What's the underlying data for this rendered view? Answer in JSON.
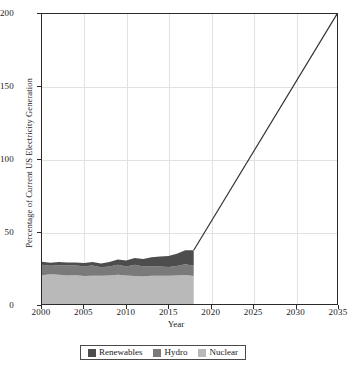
{
  "chart_data": {
    "type": "area",
    "title": "",
    "xlabel": "Year",
    "ylabel": "Percentage of Current US Electricity Generation",
    "xlim": [
      2000,
      2035
    ],
    "ylim": [
      0,
      200
    ],
    "xticks": [
      2000,
      2005,
      2010,
      2015,
      2020,
      2025,
      2030,
      2035
    ],
    "yticks": [
      0,
      50,
      100,
      150,
      200
    ],
    "grid": true,
    "legend_position": "bottom",
    "stacked": true,
    "x": [
      2000,
      2001,
      2002,
      2003,
      2004,
      2005,
      2006,
      2007,
      2008,
      2009,
      2010,
      2011,
      2012,
      2013,
      2014,
      2015,
      2016,
      2017,
      2018
    ],
    "series": [
      {
        "name": "Nuclear",
        "color": "#b9b9b9",
        "values": [
          19.8,
          20.6,
          20.2,
          19.7,
          19.9,
          19.3,
          19.4,
          19.4,
          19.6,
          20.2,
          19.6,
          19.3,
          19.0,
          19.4,
          19.5,
          19.5,
          19.7,
          20.0,
          19.3
        ]
      },
      {
        "name": "Hydro",
        "color": "#7a7a7a",
        "values": [
          7.2,
          5.7,
          6.6,
          6.8,
          6.6,
          6.7,
          7.1,
          6.0,
          6.2,
          6.9,
          6.3,
          7.8,
          6.8,
          6.6,
          6.3,
          6.1,
          6.5,
          7.4,
          7.0
        ]
      },
      {
        "name": "Renewables",
        "color": "#4d4d4d",
        "values": [
          2.2,
          2.1,
          2.2,
          2.1,
          2.2,
          2.3,
          2.4,
          2.5,
          3.1,
          3.6,
          4.1,
          4.7,
          5.3,
          6.2,
          6.9,
          7.5,
          8.4,
          9.6,
          10.8
        ]
      }
    ],
    "projection": {
      "name": "projection-line",
      "color": "#333333",
      "x": [
        2018,
        2035
      ],
      "y": [
        37.1,
        200
      ]
    }
  },
  "axes": {
    "y_title": "Percentage of Current US Electricity Generation",
    "x_title": "Year",
    "y_tick_labels": [
      "0",
      "50",
      "100",
      "150",
      "200"
    ],
    "x_tick_labels": [
      "2000",
      "2005",
      "2010",
      "2015",
      "2020",
      "2025",
      "2030",
      "2035"
    ]
  },
  "legend": {
    "entries": [
      {
        "label": "Renewables",
        "color": "#4d4d4d"
      },
      {
        "label": "Hydro",
        "color": "#7a7a7a"
      },
      {
        "label": "Nuclear",
        "color": "#b9b9b9"
      }
    ]
  }
}
